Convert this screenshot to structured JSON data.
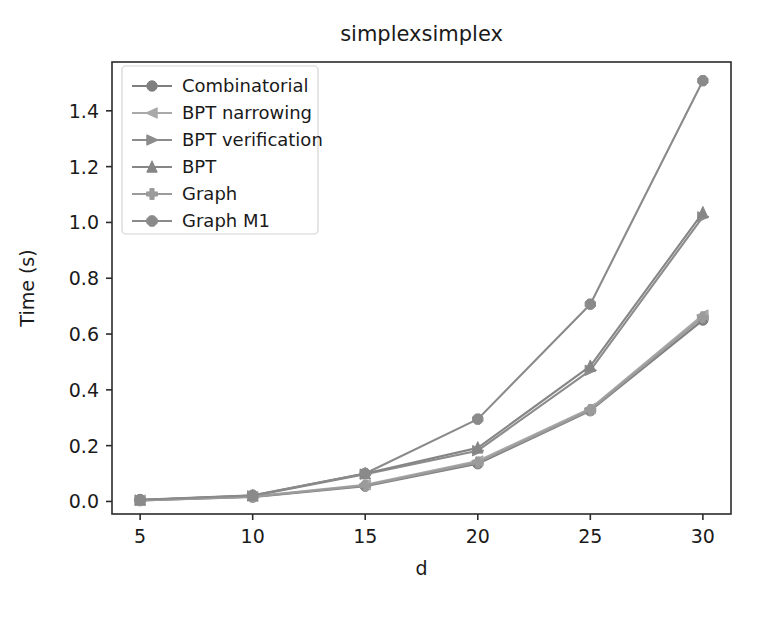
{
  "chart_data": {
    "type": "line",
    "title": "simplexsimplex",
    "xlabel": "d",
    "ylabel": "Time (s)",
    "x": [
      5,
      10,
      15,
      20,
      25,
      30
    ],
    "xlim": [
      3.75,
      31.25
    ],
    "ylim": [
      -0.045,
      1.575
    ],
    "xticks": [
      5,
      10,
      15,
      20,
      25,
      30
    ],
    "xtick_labels": [
      "5",
      "10",
      "15",
      "20",
      "25",
      "30"
    ],
    "yticks": [
      0.0,
      0.2,
      0.4,
      0.6,
      0.8,
      1.0,
      1.2,
      1.4
    ],
    "ytick_labels": [
      "0.0",
      "0.2",
      "0.4",
      "0.6",
      "0.8",
      "1.0",
      "1.2",
      "1.4"
    ],
    "grid": false,
    "legend_position": "upper left",
    "series": [
      {
        "name": "Combinatorial",
        "marker": "circle",
        "color": "#7f7f7f",
        "values": [
          0.004,
          0.016,
          0.055,
          0.135,
          0.325,
          0.65
        ]
      },
      {
        "name": "BPT narrowing",
        "marker": "triangle-left",
        "color": "#a9a9a9",
        "values": [
          0.005,
          0.018,
          0.06,
          0.145,
          0.333,
          0.668
        ]
      },
      {
        "name": "BPT verification",
        "marker": "triangle-right",
        "color": "#8c8c8c",
        "values": [
          0.005,
          0.02,
          0.098,
          0.182,
          0.47,
          1.02
        ]
      },
      {
        "name": "BPT",
        "marker": "triangle-up",
        "color": "#868686",
        "values": [
          0.005,
          0.021,
          0.1,
          0.192,
          0.485,
          1.035
        ]
      },
      {
        "name": "Graph",
        "marker": "plus-filled",
        "color": "#9b9b9b",
        "values": [
          0.004,
          0.017,
          0.057,
          0.14,
          0.328,
          0.66
        ]
      },
      {
        "name": "Graph M1",
        "marker": "octagon",
        "color": "#8a8a8a",
        "values": [
          0.006,
          0.022,
          0.1,
          0.295,
          0.707,
          1.508
        ]
      }
    ]
  },
  "axes": {
    "title_text": "simplexsimplex",
    "x_axis_label": "d",
    "y_axis_label": "Time (s)"
  },
  "legend": {
    "entries": [
      {
        "label": "Combinatorial"
      },
      {
        "label": "BPT narrowing"
      },
      {
        "label": "BPT verification"
      },
      {
        "label": "BPT"
      },
      {
        "label": "Graph"
      },
      {
        "label": "Graph M1"
      }
    ]
  }
}
